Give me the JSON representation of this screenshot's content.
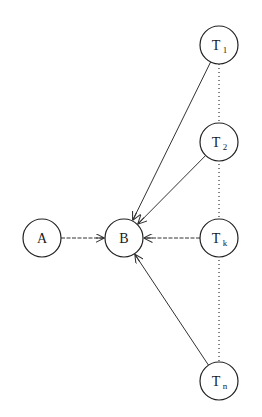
{
  "diagram": {
    "type": "directed-graph",
    "nodes": [
      {
        "id": "A",
        "label": "A",
        "sub": "",
        "cx": 42,
        "cy": 238,
        "r": 19
      },
      {
        "id": "B",
        "label": "B",
        "sub": "",
        "cx": 124,
        "cy": 238,
        "r": 19
      },
      {
        "id": "T1",
        "label": "T",
        "sub": "1",
        "cx": 219,
        "cy": 45,
        "r": 19
      },
      {
        "id": "T2",
        "label": "T",
        "sub": "2",
        "cx": 219,
        "cy": 142,
        "r": 19
      },
      {
        "id": "Tk",
        "label": "T",
        "sub": "k",
        "cx": 219,
        "cy": 238,
        "r": 19
      },
      {
        "id": "Tn",
        "label": "T",
        "sub": "n",
        "cx": 219,
        "cy": 381,
        "r": 19
      }
    ],
    "edges": [
      {
        "from": "A",
        "to": "B",
        "style": "dashed",
        "arrow": true
      },
      {
        "from": "T1",
        "to": "B",
        "style": "solid",
        "arrow": true
      },
      {
        "from": "T2",
        "to": "B",
        "style": "solid",
        "arrow": true
      },
      {
        "from": "Tk",
        "to": "B",
        "style": "dashed",
        "arrow": true
      },
      {
        "from": "Tn",
        "to": "B",
        "style": "solid",
        "arrow": true
      }
    ],
    "connectors": [
      {
        "from": "T1",
        "to": "Tn",
        "style": "dotted",
        "note": "vertical dotted line through T1, T2, Tk, Tn"
      }
    ],
    "colors": {
      "stroke": "#333333",
      "background": "#ffffff",
      "text": "#1a1a1a"
    }
  }
}
